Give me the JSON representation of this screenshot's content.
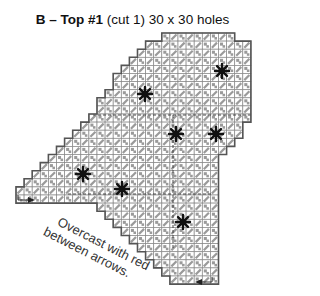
{
  "title": {
    "piece": "B – Top #1",
    "details": "(cut 1) 30 x 30 holes"
  },
  "note": {
    "line1": "Overcast with red",
    "line2": "between arrows."
  },
  "grid": {
    "cell": 8,
    "x0": 16,
    "y0": 33,
    "rows": [
      [
        18,
        27
      ],
      [
        16,
        29
      ],
      [
        15,
        29
      ],
      [
        14,
        29
      ],
      [
        13,
        29
      ],
      [
        12,
        29
      ],
      [
        12,
        29
      ],
      [
        11,
        29
      ],
      [
        10,
        29
      ],
      [
        10,
        29
      ],
      [
        9,
        29
      ],
      [
        8,
        29
      ],
      [
        8,
        28
      ],
      [
        7,
        28
      ],
      [
        6,
        27
      ],
      [
        5,
        27
      ],
      [
        4,
        26
      ],
      [
        3,
        25
      ],
      [
        2,
        25
      ],
      [
        1,
        24
      ],
      [
        0,
        24
      ],
      [
        25,
        24
      ],
      [
        24,
        24
      ]
    ],
    "row_spans": [
      {
        "r": 0,
        "a": 18,
        "b": 27
      },
      {
        "r": 1,
        "a": 16,
        "b": 29
      },
      {
        "r": 2,
        "a": 15,
        "b": 29
      },
      {
        "r": 3,
        "a": 14,
        "b": 29
      },
      {
        "r": 4,
        "a": 13,
        "b": 29
      },
      {
        "r": 5,
        "a": 12,
        "b": 29
      },
      {
        "r": 6,
        "a": 12,
        "b": 29
      },
      {
        "r": 7,
        "a": 11,
        "b": 29
      },
      {
        "r": 8,
        "a": 10,
        "b": 29
      },
      {
        "r": 9,
        "a": 10,
        "b": 29
      },
      {
        "r": 10,
        "a": 9,
        "b": 29
      },
      {
        "r": 11,
        "a": 8,
        "b": 28
      },
      {
        "r": 12,
        "a": 7,
        "b": 28
      },
      {
        "r": 13,
        "a": 6,
        "b": 27
      },
      {
        "r": 14,
        "a": 5,
        "b": 26
      },
      {
        "r": 15,
        "a": 4,
        "b": 25
      },
      {
        "r": 16,
        "a": 3,
        "b": 25
      },
      {
        "r": 17,
        "a": 2,
        "b": 25
      },
      {
        "r": 18,
        "a": 1,
        "b": 25
      },
      {
        "r": 19,
        "a": 0,
        "b": 25
      },
      {
        "r": 20,
        "a": 0,
        "b": 25
      },
      {
        "r": 21,
        "a": 10,
        "b": 25
      },
      {
        "r": 22,
        "a": 11,
        "b": 25
      },
      {
        "r": 23,
        "a": 12,
        "b": 25
      },
      {
        "r": 24,
        "a": 13,
        "b": 25
      },
      {
        "r": 25,
        "a": 14,
        "b": 25
      },
      {
        "r": 26,
        "a": 15,
        "b": 25
      },
      {
        "r": 27,
        "a": 16,
        "b": 25
      },
      {
        "r": 28,
        "a": 17,
        "b": 25
      },
      {
        "r": 29,
        "a": 18,
        "b": 25
      },
      {
        "r": 30,
        "a": 19,
        "b": 25
      }
    ],
    "stars": [
      {
        "x": 222,
        "y": 71
      },
      {
        "x": 145,
        "y": 94
      },
      {
        "x": 176,
        "y": 134
      },
      {
        "x": 216,
        "y": 134
      },
      {
        "x": 83,
        "y": 174
      },
      {
        "x": 122,
        "y": 189
      },
      {
        "x": 183,
        "y": 222
      }
    ],
    "dashed_lines": [
      {
        "x1": 93,
        "y1": 115,
        "x2": 251,
        "y2": 115
      },
      {
        "x1": 173,
        "y1": 115,
        "x2": 173,
        "y2": 250
      },
      {
        "x1": 68,
        "y1": 194,
        "x2": 212,
        "y2": 194
      }
    ],
    "arrows": [
      {
        "label": "start-arrow",
        "x": 18,
        "y": 200,
        "dir": "right"
      },
      {
        "label": "end-arrow",
        "x": 212,
        "y": 282,
        "dir": "left"
      }
    ],
    "colors": {
      "outline": "#555555",
      "cell_border": "#888888",
      "stitch": "#9a9a9a",
      "star": "#111111"
    }
  }
}
